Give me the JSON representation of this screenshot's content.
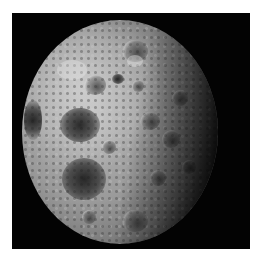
{
  "image": {
    "subject": "Moon (far side) photograph",
    "background_color": "#ffffff",
    "frame_color": "#030303",
    "surface_light": "#b8b8b8",
    "surface_shadow": "#0a0a0a"
  }
}
